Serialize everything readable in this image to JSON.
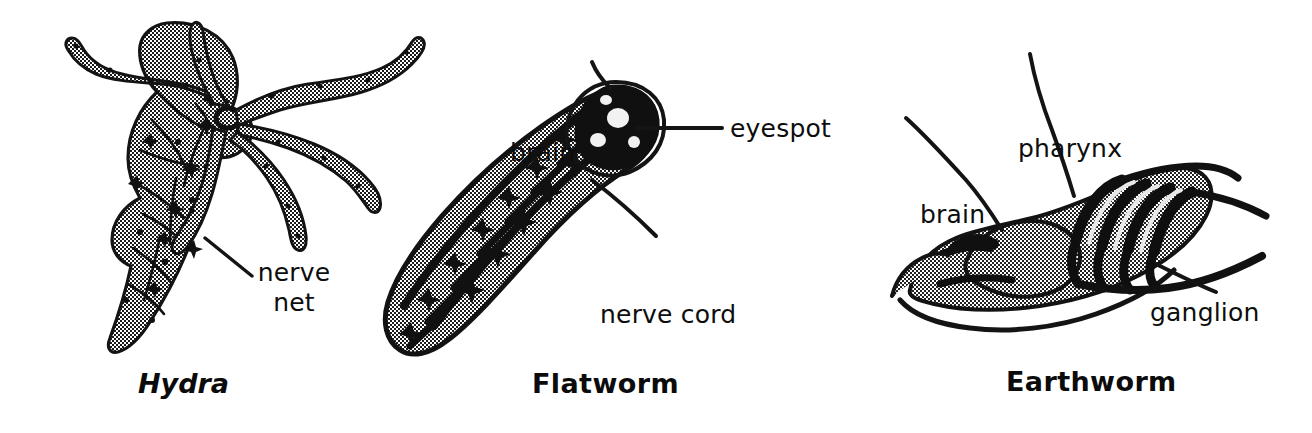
{
  "figure": {
    "background_color": "#ffffff",
    "ink_color": "#0d0d0d",
    "width": 1312,
    "height": 433
  },
  "panels": [
    {
      "id": "hydra",
      "caption": "Hydra",
      "caption_style": "bold-italic",
      "organism_icon": "hydra-nerve-net-illustration",
      "labels": [
        {
          "id": "nerve-net",
          "text_line1": "nerve",
          "text_line2": "net",
          "leader": "diagonal-up-left"
        }
      ]
    },
    {
      "id": "flatworm",
      "caption": "Flatworm",
      "caption_style": "bold",
      "organism_icon": "flatworm-ladder-nervous-system-illustration",
      "labels": [
        {
          "id": "brain",
          "text": "brain",
          "leader": "short-diagonal-down"
        },
        {
          "id": "eyespot",
          "text": "eyespot",
          "leader": "horizontal-left"
        },
        {
          "id": "nerve-cord",
          "text": "nerve cord",
          "leader": "diagonal-up-left"
        }
      ]
    },
    {
      "id": "earthworm",
      "caption": "Earthworm",
      "caption_style": "bold",
      "organism_icon": "earthworm-anterior-dissection-illustration",
      "labels": [
        {
          "id": "pharynx",
          "text": "pharynx",
          "leader": "diagonal-down-right"
        },
        {
          "id": "brain",
          "text": "brain",
          "leader": "diagonal-down-right"
        },
        {
          "id": "ganglion",
          "text": "ganglion",
          "leader": "diagonal-up-left"
        }
      ]
    }
  ]
}
